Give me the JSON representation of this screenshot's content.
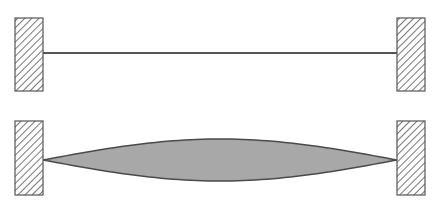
{
  "diagram": {
    "colors": {
      "background": "#ffffff",
      "wall_stroke": "#555555",
      "hatch": "#555555",
      "string": "#555555",
      "envelope_fill": "#a8a8a8",
      "envelope_stroke": "#4a4a4a"
    },
    "panels": [
      {
        "id": "string-at-rest",
        "left_wall": {
          "x": 15,
          "y": 18,
          "width": 28,
          "height": 73
        },
        "right_wall": {
          "x": 397,
          "y": 18,
          "width": 28,
          "height": 73
        },
        "string": {
          "x1": 43,
          "x2": 397,
          "y": 53
        }
      },
      {
        "id": "string-vibrating-envelope",
        "left_wall": {
          "x": 15,
          "y": 121,
          "width": 28,
          "height": 74
        },
        "right_wall": {
          "x": 397,
          "y": 121,
          "width": 28,
          "height": 74
        },
        "envelope": {
          "x1": 43,
          "x2": 397,
          "y_mid": 160,
          "half_amplitude": 21
        }
      }
    ]
  }
}
